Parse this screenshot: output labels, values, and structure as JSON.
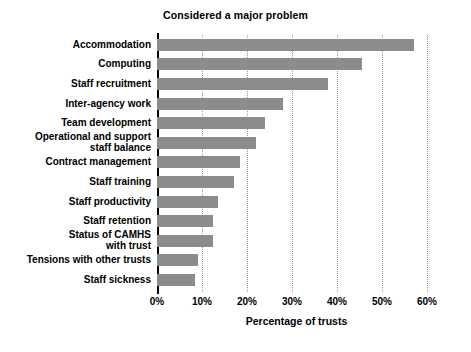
{
  "chart_data": {
    "type": "bar",
    "orientation": "horizontal",
    "title": "Considered a major problem",
    "xlabel": "Percentage of trusts",
    "ylabel": "",
    "xlim": [
      0,
      60
    ],
    "xticks": [
      0,
      10,
      20,
      30,
      40,
      50,
      60
    ],
    "xtick_labels": [
      "0%",
      "10%",
      "20%",
      "30%",
      "40%",
      "50%",
      "60%"
    ],
    "grid": "vertical-dotted",
    "legend": "none",
    "bar_color": "#8c8c8c",
    "categories": [
      "Accommodation",
      "Computing",
      "Staff recruitment",
      "Inter-agency work",
      "Team development",
      "Operational and support\nstaff balance",
      "Contract management",
      "Staff training",
      "Staff productivity",
      "Staff retention",
      "Status of CAMHS\nwith trust",
      "Tensions with other trusts",
      "Staff sickness"
    ],
    "values": [
      57,
      45.5,
      38,
      28,
      24,
      22,
      18.5,
      17,
      13.5,
      12.5,
      12.5,
      9,
      8.5
    ]
  }
}
